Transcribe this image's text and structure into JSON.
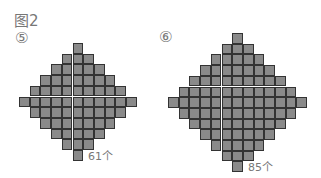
{
  "figure_title": "图2",
  "diagrams": [
    {
      "label": "⑤",
      "rows": [
        1,
        3,
        5,
        7,
        9,
        11,
        9,
        7,
        5,
        3,
        1
      ],
      "count_label": "61个",
      "fill_color": "#8a8a8a"
    },
    {
      "label": "⑥",
      "rows": [
        1,
        3,
        5,
        7,
        9,
        11,
        13,
        11,
        9,
        7,
        5,
        3,
        1
      ],
      "count_label": "85个",
      "fill_color": "#8a8a8a"
    }
  ]
}
